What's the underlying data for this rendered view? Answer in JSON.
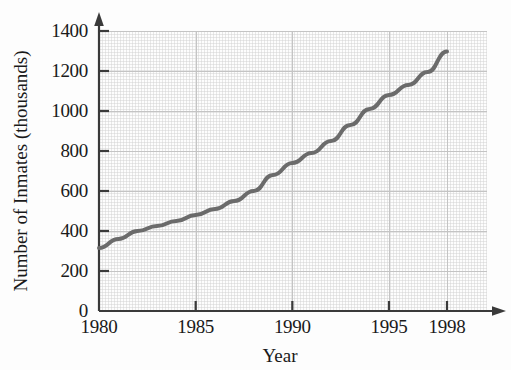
{
  "figure": {
    "title_remnant": "",
    "background": "#fdfdfd"
  },
  "axis": {
    "ylabel": "Number of Inmates (thousands)",
    "xlabel": "Year",
    "yticks": [
      "0",
      "200",
      "400",
      "600",
      "800",
      "1000",
      "1200",
      "1400"
    ],
    "xticks": [
      "1980",
      "1985",
      "1990",
      "1995",
      "1998"
    ]
  },
  "chart_data": {
    "type": "line",
    "title": "",
    "xlabel": "Year",
    "ylabel": "Number of Inmates (thousands)",
    "xlim": [
      1980,
      1998
    ],
    "ylim": [
      0,
      1400
    ],
    "xticks": [
      1980,
      1985,
      1990,
      1995,
      1998
    ],
    "yticks": [
      0,
      200,
      400,
      600,
      800,
      1000,
      1200,
      1400
    ],
    "grid": true,
    "legend": null,
    "line_color": "#6b6b6b",
    "line_width": 4,
    "x": [
      1980,
      1981,
      1982,
      1983,
      1984,
      1985,
      1986,
      1987,
      1988,
      1989,
      1990,
      1991,
      1992,
      1993,
      1994,
      1995,
      1996,
      1997,
      1998
    ],
    "values": [
      315,
      360,
      400,
      425,
      450,
      480,
      510,
      550,
      600,
      680,
      740,
      790,
      850,
      930,
      1010,
      1080,
      1130,
      1195,
      1298
    ],
    "series": [
      {
        "name": "Number of Inmates",
        "values": [
          315,
          360,
          400,
          425,
          450,
          480,
          510,
          550,
          600,
          680,
          740,
          790,
          850,
          930,
          1010,
          1080,
          1130,
          1195,
          1298
        ]
      }
    ]
  }
}
